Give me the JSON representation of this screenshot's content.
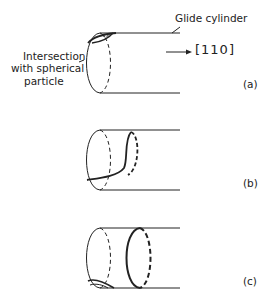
{
  "figure": {
    "labels": {
      "glide_cylinder": "Glide cylinder",
      "intersection_line1": "Intersection",
      "intersection_line2": "with spherical",
      "intersection_line3": "particle",
      "direction": "[110]"
    },
    "panels": [
      {
        "id": "a",
        "label": "(a)"
      },
      {
        "id": "b",
        "label": "(b)"
      },
      {
        "id": "c",
        "label": "(c)"
      }
    ]
  }
}
